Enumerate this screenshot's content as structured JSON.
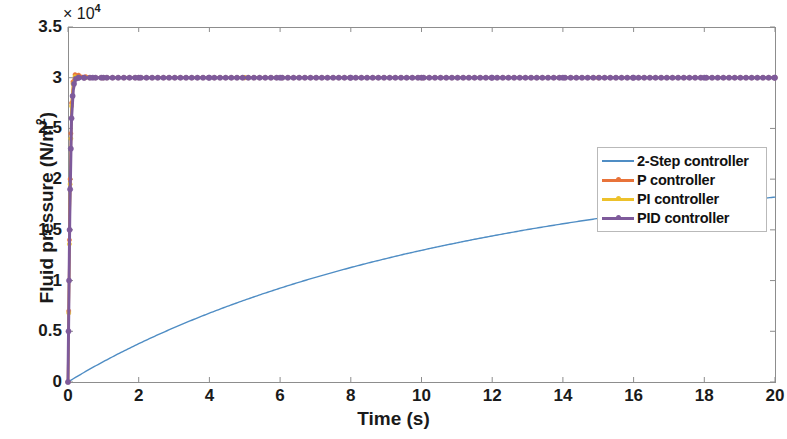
{
  "chart_data": {
    "type": "line",
    "title": "",
    "xlabel": "Time (s)",
    "ylabel": "Fluid pressure (N/m²)",
    "y_exponent_label": "× 10",
    "y_exponent_power": "4",
    "xlim": [
      0,
      20
    ],
    "ylim": [
      0,
      35000
    ],
    "xticks": [
      "0",
      "2",
      "4",
      "6",
      "8",
      "10",
      "12",
      "14",
      "16",
      "18",
      "20"
    ],
    "xtick_values": [
      0,
      2,
      4,
      6,
      8,
      10,
      12,
      14,
      16,
      18,
      20
    ],
    "yticks": [
      "0",
      "0.5",
      "1",
      "1.5",
      "2",
      "2.5",
      "3",
      "3.5"
    ],
    "ytick_values": [
      0,
      5000,
      10000,
      15000,
      20000,
      25000,
      30000,
      35000
    ],
    "grid": false,
    "legend_position": "center-right",
    "setpoint": 30000,
    "series": [
      {
        "name": "2-Step controller",
        "color": "#4f8dc4",
        "marker": "none",
        "linewidth": 1.4,
        "x": [
          0,
          0.25,
          0.5,
          0.75,
          1,
          1.5,
          2,
          2.5,
          3,
          3.5,
          4,
          4.5,
          5,
          5.5,
          6,
          6.5,
          7,
          7.5,
          8,
          8.5,
          9,
          9.5,
          10,
          10.5,
          11,
          11.5,
          12,
          12.5,
          13,
          13.5,
          14,
          14.5,
          15,
          15.5,
          16,
          16.5,
          17,
          17.5,
          18,
          18.5,
          19,
          19.5,
          20
        ],
        "y": [
          0,
          530,
          1040,
          1530,
          2010,
          2920,
          3780,
          4590,
          5360,
          6090,
          6790,
          7450,
          8080,
          8680,
          9250,
          9800,
          10320,
          10810,
          11290,
          11740,
          12170,
          12590,
          12980,
          13360,
          13720,
          14070,
          14400,
          14720,
          15030,
          15320,
          15600,
          15870,
          16130,
          16380,
          16620,
          16850,
          17070,
          17280,
          17490,
          17680,
          17870,
          18050,
          18230
        ]
      },
      {
        "name": "P controller",
        "color": "#e8733a",
        "marker": "circle",
        "linewidth": 2.4,
        "x": [
          0,
          0.02,
          0.04,
          0.06,
          0.08,
          0.1,
          0.14,
          0.2,
          0.3,
          0.5,
          1,
          2,
          5,
          10,
          15,
          20
        ],
        "y": [
          0,
          7000,
          14000,
          20000,
          24500,
          27500,
          29600,
          30300,
          30250,
          30100,
          30000,
          30000,
          30000,
          30000,
          30000,
          30000
        ]
      },
      {
        "name": "PI controller",
        "color": "#edc12b",
        "marker": "circle",
        "linewidth": 2.4,
        "x": [
          0,
          0.02,
          0.04,
          0.06,
          0.08,
          0.1,
          0.14,
          0.2,
          0.3,
          0.5,
          1,
          2,
          5,
          10,
          15,
          20
        ],
        "y": [
          0,
          6800,
          13600,
          19500,
          24000,
          27200,
          29400,
          30100,
          30050,
          30000,
          30000,
          30000,
          30000,
          30000,
          30000,
          30000
        ]
      },
      {
        "name": "PID controller",
        "color": "#7e5a9b",
        "marker": "circle",
        "linewidth": 3.0,
        "x": [
          0,
          0.015,
          0.03,
          0.045,
          0.06,
          0.08,
          0.1,
          0.13,
          0.17,
          0.22,
          0.3,
          0.45,
          0.7,
          1,
          2,
          4,
          6,
          8,
          10,
          12,
          14,
          16,
          18,
          20
        ],
        "y": [
          0,
          5000,
          10000,
          15000,
          19000,
          23000,
          26000,
          28200,
          29400,
          29900,
          30000,
          30000,
          30000,
          30000,
          30000,
          30000,
          30000,
          30000,
          30000,
          30000,
          30000,
          30000,
          30000,
          30000
        ]
      }
    ]
  },
  "legend": {
    "entries": [
      {
        "label": "2-Step controller",
        "color": "#4f8dc4",
        "marker": false
      },
      {
        "label": "P controller",
        "color": "#e8733a",
        "marker": true
      },
      {
        "label": "PI controller",
        "color": "#edc12b",
        "marker": true
      },
      {
        "label": "PID controller",
        "color": "#7e5a9b",
        "marker": true
      }
    ]
  },
  "axes": {
    "box_color": "#8d8d8d",
    "tick_color": "#8d8d8d"
  }
}
